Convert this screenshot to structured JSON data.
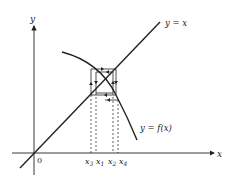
{
  "diagram": {
    "axes": {
      "x_label": "x",
      "y_label": "y",
      "origin_label": "0"
    },
    "curves": [
      {
        "name": "identity-line",
        "label": "y = x"
      },
      {
        "name": "function-curve",
        "label": "y = f(x)"
      }
    ],
    "iterates": [
      {
        "base": "x",
        "sub": "3"
      },
      {
        "base": "x",
        "sub": "1"
      },
      {
        "base": "x",
        "sub": "2"
      },
      {
        "base": "x",
        "sub": "4"
      }
    ],
    "colors": {
      "ink": "#222222",
      "background": "#ffffff"
    }
  }
}
